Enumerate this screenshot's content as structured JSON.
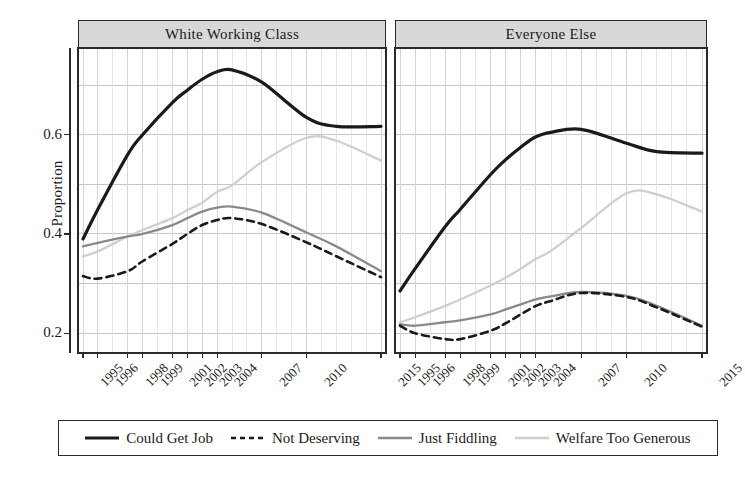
{
  "figure": {
    "ylabel": "Proportion",
    "y_ticks": [
      "0.2",
      "0.4",
      "0.6"
    ],
    "y_tick_values": [
      0.2,
      0.4,
      0.6
    ],
    "x_ticks": [
      "1995",
      "1996",
      "1998",
      "1999",
      "2001",
      "2002",
      "2003",
      "2004",
      "2007",
      "2010",
      "2015"
    ],
    "x_tick_values": [
      1995,
      1996,
      1998,
      1999,
      2001,
      2002,
      2003,
      2004,
      2007,
      2010,
      2015
    ],
    "panels": [
      {
        "title": "White Working Class"
      },
      {
        "title": "Everyone Else"
      }
    ],
    "legend": [
      {
        "label": "Could Get Job",
        "color": "#1a1a1a",
        "style": "solid",
        "width": 3.2
      },
      {
        "label": "Not Deserving",
        "color": "#1a1a1a",
        "style": "dashed",
        "width": 2.6
      },
      {
        "label": "Just Fiddling",
        "color": "#8a8a8a",
        "style": "solid",
        "width": 2.3
      },
      {
        "label": "Welfare Too Generous",
        "color": "#cfcfcf",
        "style": "solid",
        "width": 2.3
      }
    ]
  },
  "chart_data": {
    "type": "line",
    "title": "",
    "xlabel": "",
    "ylabel": "Proportion",
    "xlim": [
      1995,
      2015
    ],
    "ylim": [
      0.16,
      0.775
    ],
    "grid": true,
    "legend_position": "bottom",
    "facets": [
      "White Working Class",
      "Everyone Else"
    ],
    "x": [
      1995,
      1996,
      1998,
      1999,
      2001,
      2002,
      2003,
      2004,
      2005,
      2007,
      2010,
      2012,
      2015
    ],
    "panels": [
      {
        "name": "White Working Class",
        "series": [
          {
            "name": "Could Get Job",
            "values": [
              0.39,
              0.45,
              0.56,
              0.6,
              0.665,
              0.69,
              0.712,
              0.727,
              0.731,
              0.706,
              0.635,
              0.617,
              0.617
            ]
          },
          {
            "name": "Not Deserving",
            "values": [
              0.315,
              0.31,
              0.325,
              0.345,
              0.38,
              0.4,
              0.418,
              0.428,
              0.432,
              0.42,
              0.383,
              0.355,
              0.313
            ]
          },
          {
            "name": "Just Fiddling",
            "values": [
              0.375,
              0.382,
              0.395,
              0.4,
              0.418,
              0.432,
              0.445,
              0.453,
              0.455,
              0.443,
              0.403,
              0.375,
              0.325
            ]
          },
          {
            "name": "Welfare Too Generous",
            "values": [
              0.355,
              0.365,
              0.395,
              0.408,
              0.432,
              0.448,
              0.463,
              0.485,
              0.498,
              0.545,
              0.594,
              0.588,
              0.548
            ]
          }
        ]
      },
      {
        "name": "Everyone Else",
        "series": [
          {
            "name": "Could Get Job",
            "values": [
              0.285,
              0.33,
              0.415,
              0.45,
              0.52,
              0.55,
              0.575,
              0.596,
              0.605,
              0.611,
              0.583,
              0.566,
              0.563
            ]
          },
          {
            "name": "Not Deserving",
            "values": [
              0.215,
              0.2,
              0.188,
              0.188,
              0.205,
              0.22,
              0.238,
              0.255,
              0.265,
              0.281,
              0.273,
              0.252,
              0.213
            ]
          },
          {
            "name": "Just Fiddling",
            "values": [
              0.218,
              0.215,
              0.222,
              0.226,
              0.238,
              0.248,
              0.258,
              0.268,
              0.274,
              0.283,
              0.275,
              0.255,
              0.215
            ]
          },
          {
            "name": "Welfare Too Generous",
            "values": [
              0.222,
              0.232,
              0.255,
              0.268,
              0.296,
              0.312,
              0.33,
              0.35,
              0.366,
              0.412,
              0.482,
              0.48,
              0.445
            ]
          }
        ]
      }
    ]
  }
}
